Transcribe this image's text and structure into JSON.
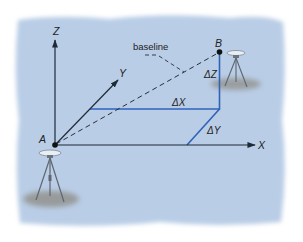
{
  "figure": {
    "background_color": "#b9cde6",
    "axis_color": "#1f2a36",
    "component_color": "#2f63b8",
    "baseline_color": "#2a2f3a"
  },
  "axes": {
    "x_label": "X",
    "y_label": "Y",
    "z_label": "Z"
  },
  "points": {
    "a_label": "A",
    "b_label": "B"
  },
  "baseline": {
    "label": "baseline"
  },
  "components": {
    "dx_label": "ΔX",
    "dy_label": "ΔY",
    "dz_label": "ΔZ"
  },
  "icons": {
    "receiver_a": "gps-tripod-icon",
    "receiver_b": "gps-tripod-icon"
  }
}
